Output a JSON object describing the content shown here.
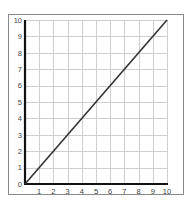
{
  "chart_data": {
    "type": "line",
    "title": "",
    "xlabel": "",
    "ylabel": "",
    "xlim": [
      0,
      10
    ],
    "ylim": [
      0,
      10
    ],
    "grid": true,
    "legend": null,
    "x_ticks": [
      "1",
      "2",
      "3",
      "4",
      "5",
      "6",
      "7",
      "8",
      "9",
      "10"
    ],
    "y_ticks": [
      "0",
      "1",
      "2",
      "3",
      "4",
      "5",
      "6",
      "7",
      "8",
      "9",
      "10"
    ],
    "series": [
      {
        "name": "y = x",
        "x": [
          0,
          10
        ],
        "y": [
          0,
          10
        ],
        "color": "#333333"
      }
    ]
  },
  "style": {
    "frame_color": "#8a8a8a",
    "grid_color": "#cfcfcf",
    "axis_color": "#111111",
    "line_color": "#333333"
  }
}
